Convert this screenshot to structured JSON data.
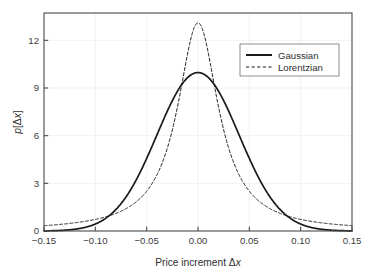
{
  "chart_data": {
    "type": "line",
    "title": "",
    "xlabel": "Price increment Δx",
    "ylabel": "p[Δx]",
    "xlim": [
      -0.15,
      0.15
    ],
    "ylim": [
      0,
      13.72
    ],
    "grid": true,
    "legend_position": "upper right",
    "xticks": [
      -0.15,
      -0.1,
      -0.05,
      0.0,
      0.05,
      0.1,
      0.15
    ],
    "xticklabels": [
      "−0.15",
      "−0.10",
      "−0.05",
      "0.00",
      "0.05",
      "0.10",
      "0.15"
    ],
    "yticks": [
      0,
      3,
      6,
      9,
      12
    ],
    "yticklabels": [
      "0",
      "3",
      "6",
      "9",
      "12"
    ],
    "series": [
      {
        "name": "Gaussian",
        "style": "solid",
        "color": "#1a1a1a",
        "width": 1.7,
        "peak_value": 9.97,
        "peak_x": 0.0,
        "sigma": 0.04,
        "x": [
          -0.15,
          -0.14,
          -0.13,
          -0.12,
          -0.11,
          -0.1,
          -0.09,
          -0.08,
          -0.07,
          -0.06,
          -0.05,
          -0.04,
          -0.03,
          -0.02,
          -0.01,
          0.0,
          0.01,
          0.02,
          0.03,
          0.04,
          0.05,
          0.06,
          0.07,
          0.08,
          0.09,
          0.1,
          0.11,
          0.12,
          0.13,
          0.14,
          0.15
        ],
        "y": [
          0.08,
          0.21,
          0.49,
          1.05,
          2.06,
          3.67,
          5.97,
          8.87,
          11.98,
          14.75,
          16.69,
          17.41,
          16.69,
          14.75,
          11.98,
          9.97,
          11.98,
          14.75,
          16.69,
          17.41,
          16.69,
          14.75,
          11.98,
          8.87,
          5.97,
          3.67,
          2.06,
          1.05,
          0.49,
          0.21,
          0.08
        ]
      },
      {
        "name": "Lorentzian",
        "style": "dashed",
        "color": "#1a1a1a",
        "width": 1.0,
        "peak_value": 13.1,
        "peak_x": 0.0,
        "gamma": 0.0243,
        "x": [
          -0.15,
          -0.14,
          -0.13,
          -0.12,
          -0.11,
          -0.1,
          -0.09,
          -0.08,
          -0.07,
          -0.06,
          -0.05,
          -0.04,
          -0.03,
          -0.02,
          -0.01,
          0.0,
          0.01,
          0.02,
          0.03,
          0.04,
          0.05,
          0.06,
          0.07,
          0.08,
          0.09,
          0.1,
          0.11,
          0.12,
          0.13,
          0.14,
          0.15
        ],
        "y": [
          0.34,
          0.39,
          0.45,
          0.53,
          0.63,
          0.76,
          0.94,
          1.19,
          1.55,
          2.09,
          2.96,
          4.42,
          6.93,
          10.53,
          13.0,
          13.1,
          13.0,
          10.53,
          6.93,
          4.42,
          2.96,
          2.09,
          1.55,
          1.19,
          0.94,
          0.76,
          0.63,
          0.53,
          0.45,
          0.39,
          0.34
        ]
      }
    ],
    "notes": {
      "crossing_points_x": [
        -0.09,
        0.09
      ],
      "gaussian_tail_at_edge": 0.02,
      "lorentzian_tail_at_edge": 0.45
    }
  },
  "legend": {
    "items": [
      {
        "label": "Gaussian"
      },
      {
        "label": "Lorentzian"
      }
    ]
  },
  "axes": {
    "x_title_prefix": "Price increment ",
    "x_title_delta": "Δ",
    "x_title_var": "x",
    "y_title_var": "p",
    "y_title_bracket_open": "[",
    "y_title_delta": "Δ",
    "y_title_var2": "x",
    "y_title_bracket_close": "]"
  },
  "colors": {
    "axis": "#4a4a4a",
    "grid": "#ededed",
    "curve": "#1a1a1a",
    "background": "#ffffff",
    "text": "#2e2e2e"
  }
}
